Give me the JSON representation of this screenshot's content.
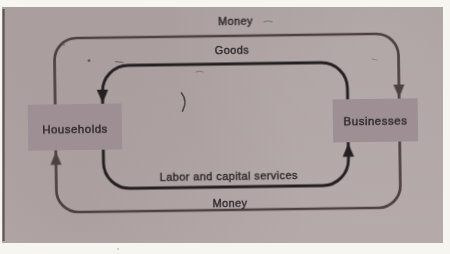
{
  "diagram": {
    "type": "circular-flow-diagram",
    "boxes": {
      "households": {
        "label": "Households"
      },
      "businesses": {
        "label": "Businesses"
      }
    },
    "flows": [
      {
        "id": "money-top",
        "label": "Money",
        "from": "households",
        "to": "businesses",
        "loop": "outer",
        "edge": "top"
      },
      {
        "id": "goods",
        "label": "Goods",
        "from": "businesses",
        "to": "households",
        "loop": "inner",
        "edge": "top"
      },
      {
        "id": "labor",
        "label": "Labor and capital services",
        "from": "households",
        "to": "businesses",
        "loop": "inner",
        "edge": "bottom"
      },
      {
        "id": "money-bottom",
        "label": "Money",
        "from": "businesses",
        "to": "households",
        "loop": "outer",
        "edge": "bottom"
      }
    ],
    "colors": {
      "page_margin": "#f7f5f0",
      "scan_background": "#b1a6a5",
      "box_fill": "#9d8f93",
      "outer_money_loop": "#4e4142",
      "inner_goods_labor_loop": "#242021",
      "label_text": "#2a2527",
      "scan_edge": "#4a423f"
    }
  }
}
